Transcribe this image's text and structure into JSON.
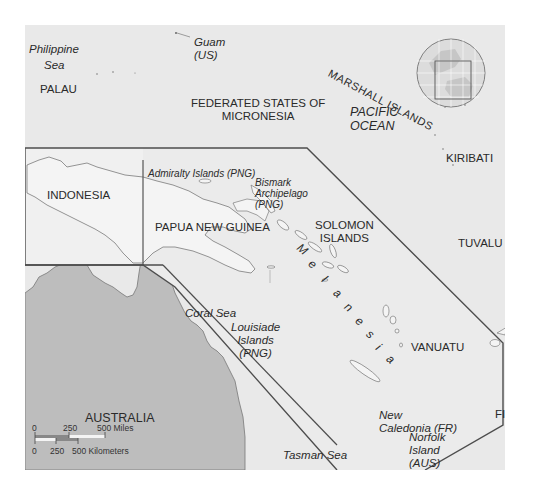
{
  "map": {
    "title": "Melanesia region map",
    "colors": {
      "ocean": "#e9e9e9",
      "land_highlight": "#f2f2f2",
      "australia": "#bdbdbd",
      "outline": "#555555",
      "text": "#2a2a2a"
    },
    "labels": {
      "philippine_sea": [
        "Philippine",
        "Sea"
      ],
      "palau": "PALAU",
      "guam": [
        "Guam",
        "(US)"
      ],
      "micronesia": [
        "FEDERATED STATES OF",
        "MICRONESIA"
      ],
      "marshall_islands": "MARSHALL ISLANDS",
      "pacific_ocean": [
        "PACIFIC",
        "OCEAN"
      ],
      "kiribati": "KIRIBATI",
      "indonesia": "INDONESIA",
      "admiralty": "Admiralty Islands (PNG)",
      "bismark": [
        "Bismark",
        "Archipelago",
        "(PNG)"
      ],
      "papua_new_guinea": "PAPUA NEW GUINEA",
      "solomon": [
        "SOLOMON",
        "ISLANDS"
      ],
      "tuvalu": "TUVALU",
      "melanesia": [
        "M",
        "e",
        "l",
        "a",
        "n",
        "e",
        "s",
        "i",
        "a"
      ],
      "coral_sea": "Coral Sea",
      "louisiade": [
        "Louisiade",
        "Islands",
        "(PNG)"
      ],
      "vanuatu": "VANUATU",
      "fiji": "FIJI",
      "australia": "AUSTRALIA",
      "new_caledonia": [
        "New",
        "Caledonia (FR)"
      ],
      "norfolk": [
        "Norfolk",
        "Island",
        "(AUS)"
      ],
      "tasman_sea": "Tasman Sea"
    },
    "scale_bar": {
      "miles": {
        "ticks": [
          "0",
          "250",
          "500 Miles"
        ]
      },
      "kilometers": {
        "ticks": [
          "0",
          "250",
          "500 Kilometers"
        ]
      }
    },
    "locator_globe": {
      "description": "Globe inset with highlighted rectangle over Oceania"
    }
  }
}
